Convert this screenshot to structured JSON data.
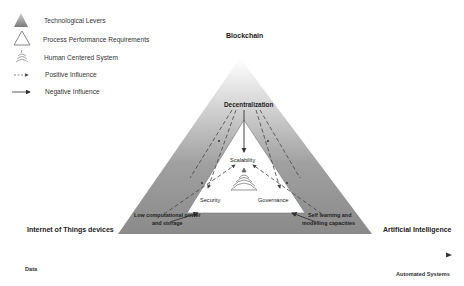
{
  "legend": {
    "items": [
      {
        "icon": "shaded-triangle-icon",
        "label": "Technological Levers"
      },
      {
        "icon": "outline-triangle-icon",
        "label": "Process Performance Requirements"
      },
      {
        "icon": "human-centered-wave-icon",
        "label": "Human Centered System"
      },
      {
        "icon": "dashed-arrow-icon",
        "label": "Positive Influence"
      },
      {
        "icon": "solid-arrow-icon",
        "label": "Negative Influence"
      }
    ]
  },
  "outer_triangle": {
    "top": "Blockchain",
    "bottom_left": "Internet of Things devices",
    "bottom_right": "Artificial Intelligence",
    "fill_top": "#ffffff",
    "fill_bottom": "#8a8a8a"
  },
  "inner_nodes": {
    "decentralization": "Decentralization",
    "scalability": "Scalability",
    "security": "Security",
    "governance": "Governance",
    "low_power_line1": "Low computational power",
    "low_power_line2": "and storage",
    "self_learning_line1": "Self learning and",
    "self_learning_line2": "modelling capacities"
  },
  "signs": {
    "positive": "+",
    "negative": "-"
  },
  "axis": {
    "start_label": "Data",
    "end_label": "Automated Systems"
  }
}
